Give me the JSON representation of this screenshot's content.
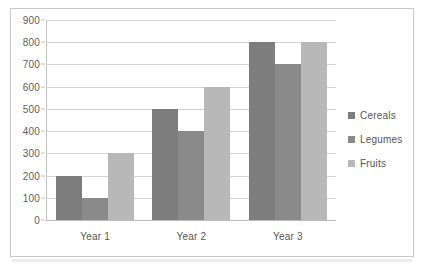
{
  "chart_data": {
    "type": "bar",
    "title": "",
    "xlabel": "",
    "ylabel": "",
    "categories": [
      "Year 1",
      "Year 2",
      "Year 3"
    ],
    "series": [
      {
        "name": "Cereals",
        "values": [
          200,
          500,
          800
        ],
        "color": "#7d7d7d"
      },
      {
        "name": "Legumes",
        "values": [
          100,
          400,
          700
        ],
        "color": "#8a8a8a"
      },
      {
        "name": "Fruits",
        "values": [
          300,
          600,
          800
        ],
        "color": "#b8b8b8"
      }
    ],
    "ylim": [
      0,
      900
    ],
    "ytick_step": 100,
    "ytick_labels": [
      "900",
      "800",
      "700",
      "600",
      "500",
      "400",
      "300",
      "200",
      "100",
      "0"
    ],
    "grid": "horizontal",
    "legend_position": "right"
  }
}
